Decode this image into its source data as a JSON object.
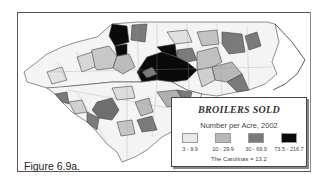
{
  "figure": {
    "caption": "Figure 6.9a.",
    "region": "North Carolina and South Carolina counties"
  },
  "legend": {
    "title": "BROILERS SOLD",
    "subtitle": "Number per Acre, 2002",
    "classes": [
      {
        "label": "3 - 9.9",
        "color": "#e8e8e8"
      },
      {
        "label": "10 - 29.9",
        "color": "#b8b8b8"
      },
      {
        "label": "30 - 69.9",
        "color": "#7a7a7a"
      },
      {
        "label": "73.5 - 216.7",
        "color": "#0a0a0a"
      }
    ],
    "note": "The Carolinas = 13.2"
  },
  "colors": {
    "border": "#444444",
    "background": "#ffffff"
  }
}
